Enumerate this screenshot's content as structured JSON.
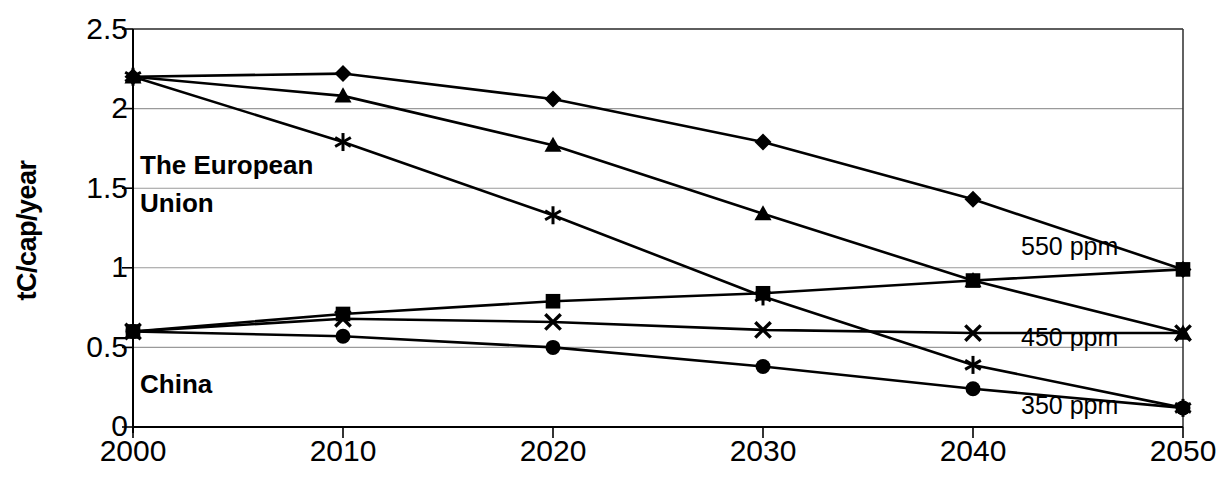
{
  "chart_data": {
    "type": "line",
    "title": "",
    "subtitle": "",
    "xlabel": "",
    "ylabel": "tC/cap/year",
    "x": [
      2000,
      2010,
      2020,
      2030,
      2040,
      2050
    ],
    "xtick_labels": [
      "2000",
      "2010",
      "2020",
      "2030",
      "2040",
      "2050"
    ],
    "ytick_labels": [
      "0",
      "0.5",
      "1",
      "1.5",
      "2",
      "2.5"
    ],
    "yticks": [
      0,
      0.5,
      1,
      1.5,
      2,
      2.5
    ],
    "ylim": [
      0,
      2.5
    ],
    "xlim": [
      2000,
      2050
    ],
    "grid": "horizontal",
    "legend_position": "inline-right",
    "series": [
      {
        "name": "The European Union 550 ppm",
        "region": "The European Union",
        "scenario": "550 ppm",
        "marker": "diamond",
        "values": [
          2.2,
          2.22,
          2.06,
          1.79,
          1.43,
          0.99
        ]
      },
      {
        "name": "The European Union 450 ppm",
        "region": "The European Union",
        "scenario": "450 ppm",
        "marker": "triangle",
        "values": [
          2.2,
          2.08,
          1.77,
          1.34,
          0.92,
          0.59
        ]
      },
      {
        "name": "The European Union 350 ppm",
        "region": "The European Union",
        "scenario": "350 ppm",
        "marker": "star",
        "values": [
          2.2,
          1.79,
          1.33,
          0.82,
          0.39,
          0.12
        ]
      },
      {
        "name": "China 550 ppm",
        "region": "China",
        "scenario": "550 ppm",
        "marker": "square",
        "values": [
          0.6,
          0.71,
          0.79,
          0.84,
          0.92,
          0.99
        ]
      },
      {
        "name": "China 450 ppm",
        "region": "China",
        "scenario": "450 ppm",
        "marker": "cross",
        "values": [
          0.6,
          0.68,
          0.66,
          0.61,
          0.59,
          0.59
        ]
      },
      {
        "name": "China 350 ppm",
        "region": "China",
        "scenario": "350 ppm",
        "marker": "circle",
        "values": [
          0.6,
          0.57,
          0.5,
          0.38,
          0.24,
          0.12
        ]
      }
    ],
    "annotations": [
      {
        "text": "The European",
        "x": 2001,
        "y": 1.62
      },
      {
        "text": "Union",
        "x": 2001,
        "y": 1.38
      },
      {
        "text": "China",
        "x": 2001,
        "y": 0.25
      }
    ],
    "series_end_labels": [
      {
        "text": "550 ppm",
        "y": 1.0
      },
      {
        "text": "450 ppm",
        "y": 0.6
      },
      {
        "text": "350 ppm",
        "y": 0.13
      }
    ]
  },
  "annotation_text": {
    "eu_line1": "The European",
    "eu_line2": "Union",
    "china": "China"
  },
  "end_labels": {
    "ppm550": "550 ppm",
    "ppm450": "450 ppm",
    "ppm350": "350 ppm"
  },
  "axes": {
    "y_title": "tC/cap/year"
  },
  "colors": {
    "line": "#000000",
    "grid": "#9a9a9a",
    "axis": "#3a3a3a",
    "background": "#ffffff"
  }
}
